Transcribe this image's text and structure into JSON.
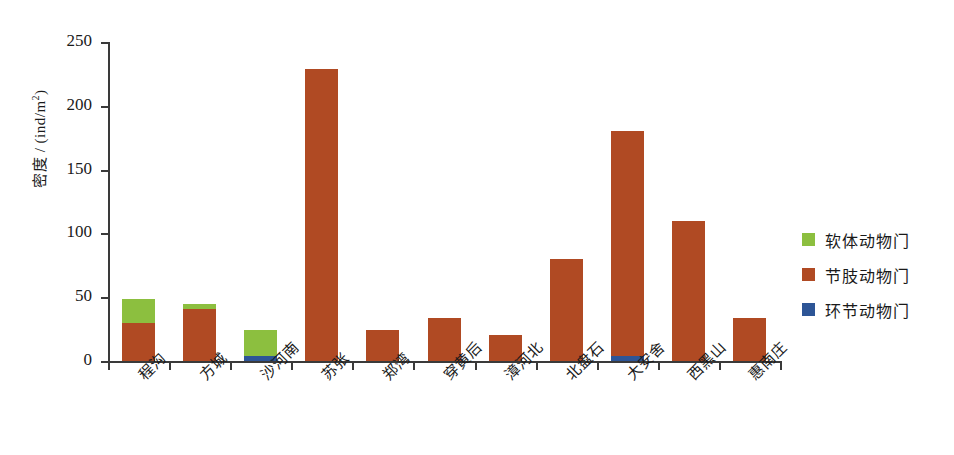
{
  "chart_data": {
    "type": "bar",
    "subtype": "stacked",
    "title": "",
    "xlabel": "",
    "ylabel": "密度 / (ind/m2)",
    "ylabel_base": "密度 / (ind/m",
    "ylabel_sup": "2",
    "ylabel_close": ")",
    "ylim": [
      0,
      250
    ],
    "ytick_values": [
      0,
      50,
      100,
      150,
      200,
      250
    ],
    "ytick_labels": [
      "0",
      "50",
      "100",
      "150",
      "200",
      "250"
    ],
    "grid": false,
    "legend_position": "right",
    "categories": [
      "程沟",
      "方城",
      "沙河南",
      "苏张",
      "郑湾",
      "穿黄后",
      "漳河北",
      "北盘石",
      "大安舍",
      "西黑山",
      "惠南庄"
    ],
    "series": [
      {
        "name": "环节动物门",
        "color": "#2d5596",
        "values": [
          0,
          0,
          4,
          0,
          0,
          0,
          0,
          0,
          4,
          0,
          0
        ]
      },
      {
        "name": "节肢动物门",
        "color": "#b04a23",
        "values": [
          30,
          41,
          0,
          229,
          24,
          34,
          20,
          80,
          176,
          110,
          34
        ]
      },
      {
        "name": "软体动物门",
        "color": "#8cbf3f",
        "values": [
          19,
          4,
          20,
          0,
          0,
          0,
          0,
          0,
          0,
          0,
          0
        ]
      }
    ],
    "totals": [
      49,
      45,
      24,
      229,
      24,
      34,
      20,
      80,
      180,
      110,
      34
    ]
  },
  "legend": {
    "items": [
      {
        "label": "软体动物门",
        "color": "#8cbf3f"
      },
      {
        "label": "节肢动物门",
        "color": "#b04a23"
      },
      {
        "label": "环节动物门",
        "color": "#2d5596"
      }
    ]
  }
}
